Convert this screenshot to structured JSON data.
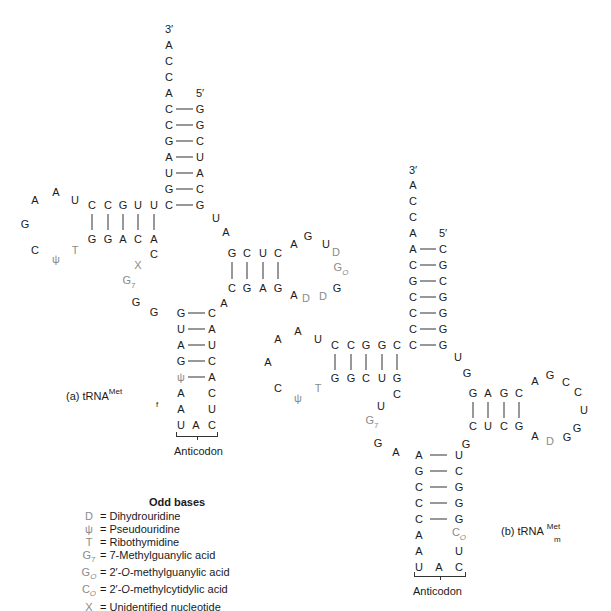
{
  "figure": {
    "trna_a": {
      "label_prefix": "(a) tRNA",
      "label_sup": "Met",
      "label_sub": "f",
      "acceptor_3prime_label": "3′",
      "acceptor_5prime_label": "5′",
      "acceptor_unpaired_3prime": [
        "A",
        "C",
        "C",
        "A"
      ],
      "acceptor_stem": [
        [
          "C",
          "G"
        ],
        [
          "C",
          "G"
        ],
        [
          "G",
          "C"
        ],
        [
          "A",
          "U"
        ],
        [
          "U",
          "A"
        ],
        [
          "G",
          "C"
        ],
        [
          "C",
          "G"
        ]
      ],
      "t_arm_top": [
        "C",
        "C",
        "G",
        "U",
        "U"
      ],
      "t_arm_bottom": [
        "G",
        "G",
        "A",
        "C",
        "A"
      ],
      "t_loop": [
        "U",
        "A",
        "A",
        "G",
        "C",
        "ψ",
        "T"
      ],
      "d_arm_top": [
        "G",
        "C",
        "U",
        "C"
      ],
      "d_arm_bottom": [
        "C",
        "G",
        "A",
        "G"
      ],
      "d_loop": [
        "A",
        "G",
        "U",
        "D",
        "G_O",
        "G",
        "D",
        "D",
        "A"
      ],
      "anticodon_stem": [
        [
          "G",
          "C"
        ],
        [
          "U",
          "A"
        ],
        [
          "A",
          "U"
        ],
        [
          "G",
          "C"
        ],
        [
          "ψ",
          "A"
        ]
      ],
      "anticodon_loop_left": [
        "A",
        "A",
        "U"
      ],
      "anticodon_loop_right": [
        "C",
        "U",
        "C"
      ],
      "anticodon": [
        "U",
        "A",
        "C"
      ],
      "anticodon_label": "Anticodon",
      "variable_loop": [
        "C",
        "X",
        "G7",
        "G",
        "G"
      ],
      "connectors": [
        "U",
        "A",
        "A"
      ]
    },
    "trna_b": {
      "label_prefix": "(b) tRNA",
      "label_sup": "Met",
      "label_sub": "m",
      "acceptor_3prime_label": "3′",
      "acceptor_5prime_label": "5′",
      "acceptor_unpaired_3prime": [
        "A",
        "C",
        "C",
        "A"
      ],
      "acceptor_stem": [
        [
          "A",
          "C"
        ],
        [
          "C",
          "G"
        ],
        [
          "G",
          "C"
        ],
        [
          "C",
          "G"
        ],
        [
          "C",
          "G"
        ],
        [
          "C",
          "G"
        ],
        [
          "C",
          "G"
        ]
      ],
      "t_arm_top": [
        "C",
        "C",
        "G",
        "G",
        "C"
      ],
      "t_arm_bottom": [
        "G",
        "G",
        "C",
        "U",
        "G"
      ],
      "t_loop": [
        "U",
        "A",
        "A",
        "A",
        "C",
        "ψ",
        "T"
      ],
      "d_arm_top": [
        "G",
        "A",
        "G",
        "C"
      ],
      "d_arm_bottom": [
        "C",
        "U",
        "C",
        "G"
      ],
      "d_loop": [
        "A",
        "G",
        "C",
        "C",
        "U",
        "G",
        "G",
        "D",
        "A"
      ],
      "anticodon_stem": [
        [
          "A",
          "U"
        ],
        [
          "G",
          "C"
        ],
        [
          "C",
          "G"
        ],
        [
          "C",
          "G"
        ],
        [
          "C",
          "G"
        ]
      ],
      "anticodon_loop_left": [
        "A",
        "A",
        "U"
      ],
      "anticodon_loop_right": [
        "C_O",
        "U",
        "C"
      ],
      "anticodon": [
        "U",
        "A",
        "C"
      ],
      "anticodon_label": "Anticodon",
      "variable_loop": [
        "C",
        "U",
        "G7",
        "G",
        "A"
      ],
      "connectors": [
        "U",
        "G",
        "G"
      ]
    },
    "legend": {
      "title": "Odd bases",
      "items": [
        {
          "symbol": "D",
          "description": "= Dihydrouridine"
        },
        {
          "symbol": "ψ",
          "description": "= Pseudouridine"
        },
        {
          "symbol": "T",
          "description": "= Ribothymidine"
        },
        {
          "symbol": "G7",
          "description": "= 7-Methylguanylic acid"
        },
        {
          "symbol": "GO",
          "description_pre": "= 2′-",
          "description_italic": "O",
          "description_post": "-methylguanylic acid"
        },
        {
          "symbol": "CO",
          "description_pre": "= 2′-",
          "description_italic": "O",
          "description_post": "-methylcytidylic acid"
        },
        {
          "symbol": "X",
          "description": "= Unidentified nucleotide"
        }
      ]
    },
    "colors": {
      "standard_base": "#1a1a1a",
      "odd_base": "#8a8a8a",
      "bond": "#333333",
      "background": "#ffffff"
    }
  }
}
